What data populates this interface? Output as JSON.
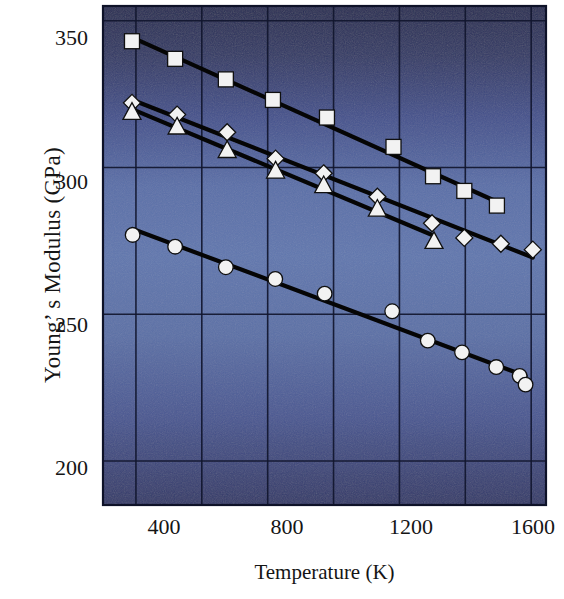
{
  "chart_data": {
    "type": "scatter",
    "title": "",
    "xlabel": "Temperature (K)",
    "ylabel": "Young’ s Modulus (GPa)",
    "xlim": [
      300,
      1645
    ],
    "ylim": [
      185,
      355
    ],
    "xticks": [
      400,
      800,
      1200,
      1600
    ],
    "xtick_labels": [
      "400",
      "800",
      "1200",
      "1600"
    ],
    "yticks": [
      200,
      250,
      300,
      350
    ],
    "ytick_labels": [
      "200",
      "250",
      "300",
      "350"
    ],
    "gridlines_x": [
      400,
      600,
      800,
      1000,
      1200,
      1400,
      1600
    ],
    "gridlines_y": [
      200,
      250,
      300,
      350
    ],
    "grid": true,
    "legend": "none",
    "background": "vertical gradient navy to blue",
    "colors": {
      "plot_top": "#2b3058",
      "plot_mid": "#5d72ac",
      "plot_bottom": "#34396b",
      "marker_fill": "#f2f2f2",
      "marker_edge": "#101010",
      "line": "#050505",
      "text": "#151515"
    },
    "series": [
      {
        "name": "squares",
        "marker": "square",
        "x": [
          388,
          519,
          673,
          816,
          980,
          1182,
          1302,
          1397,
          1496
        ],
        "y": [
          343,
          337,
          330,
          323,
          317,
          307,
          297,
          292,
          287
        ]
      },
      {
        "name": "diamonds",
        "marker": "diamond",
        "x": [
          388,
          525,
          677,
          824,
          970,
          1133,
          1299,
          1397,
          1508,
          1605
        ],
        "y": [
          322,
          318,
          312,
          303,
          298,
          290,
          281,
          276,
          274,
          272
        ]
      },
      {
        "name": "triangles",
        "marker": "triangle",
        "x": [
          388,
          525,
          677,
          824,
          970,
          1133,
          1305
        ],
        "y": [
          319,
          314,
          306,
          299,
          294,
          286,
          275
        ]
      },
      {
        "name": "circles",
        "marker": "circle",
        "x": [
          390,
          519,
          673,
          823,
          973,
          1178,
          1286,
          1390,
          1494,
          1565,
          1583
        ],
        "y": [
          277,
          273,
          266,
          262,
          257,
          251,
          241,
          237,
          232,
          229,
          226
        ]
      }
    ]
  }
}
